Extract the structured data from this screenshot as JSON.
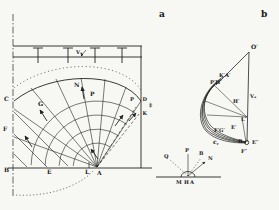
{
  "figure": {
    "background": "#f7f7f4",
    "ink_color": "#222220",
    "panels": {
      "a": {
        "label": "a"
      },
      "b": {
        "label": "b"
      },
      "c": {
        "label": "c,"
      }
    },
    "diagram_a": {
      "surcharge_label": "Vₐ",
      "points": {
        "C": "C",
        "G": "G",
        "F": "F",
        "B": "B",
        "E": "E",
        "L": "L",
        "A": "A",
        "N": "N",
        "P_top": "P",
        "P_wall": "P",
        "D": "D",
        "K": "K",
        "wall_mark": "‡"
      }
    },
    "diagram_b": {
      "velocity_label": "Vₐ",
      "points": {
        "O": "O′",
        "KA": "K′A′",
        "PH": "P′H′",
        "H": "H′",
        "L": "L′",
        "E": "E′",
        "FG": "F′G′",
        "B": "B",
        "E2": "E″",
        "F2": "F″"
      }
    },
    "diagram_c": {
      "points": {
        "Q": "Q",
        "P": "P",
        "B": "B",
        "N": "N",
        "M": "M",
        "H": "H",
        "A": "A"
      }
    }
  }
}
